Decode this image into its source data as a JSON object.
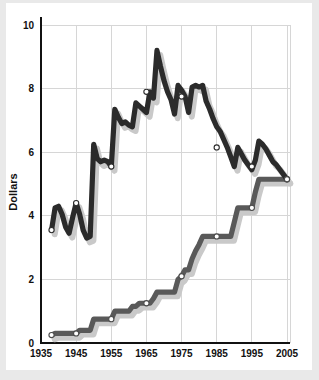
{
  "chart_data": {
    "type": "line",
    "title": "",
    "xlabel": "",
    "ylabel": "Dollars",
    "xlim": [
      1935,
      2005
    ],
    "ylim": [
      0,
      10
    ],
    "grid": true,
    "legend": "none",
    "x_ticks": [
      "1935",
      "1945",
      "1955",
      "1965",
      "1975",
      "1985",
      "1995",
      "2005"
    ],
    "y_ticks": [
      "0",
      "2",
      "4",
      "6",
      "8",
      "10"
    ],
    "x_tick_values": [
      1935,
      1945,
      1955,
      1965,
      1975,
      1985,
      1995,
      2005
    ],
    "y_tick_values": [
      0,
      2,
      4,
      6,
      8,
      10
    ],
    "marker_years": [
      1935,
      1945,
      1955,
      1965,
      1975,
      1985,
      1995,
      2005
    ],
    "series": [
      {
        "name": "Real (inflation-adjusted) minimum wage",
        "color": "#2b2b2b",
        "x": [
          1938,
          1939,
          1940,
          1941,
          1942,
          1943,
          1944,
          1945,
          1946,
          1947,
          1948,
          1949,
          1950,
          1951,
          1952,
          1953,
          1954,
          1955,
          1956,
          1957,
          1958,
          1959,
          1960,
          1961,
          1962,
          1963,
          1964,
          1965,
          1966,
          1967,
          1968,
          1969,
          1970,
          1971,
          1972,
          1973,
          1974,
          1975,
          1976,
          1977,
          1978,
          1979,
          1980,
          1981,
          1982,
          1983,
          1984,
          1985,
          1986,
          1987,
          1988,
          1989,
          1990,
          1991,
          1992,
          1993,
          1994,
          1995,
          1996,
          1997,
          1998,
          1999,
          2000,
          2001,
          2002,
          2003,
          2004,
          2005
        ],
        "y": [
          3.55,
          4.25,
          4.3,
          4.05,
          3.65,
          3.45,
          3.95,
          4.4,
          4.05,
          3.55,
          3.3,
          3.35,
          6.25,
          5.8,
          5.7,
          5.75,
          5.7,
          5.55,
          7.35,
          7.1,
          6.9,
          6.95,
          6.85,
          6.8,
          7.55,
          7.45,
          7.35,
          7.25,
          7.9,
          7.7,
          9.2,
          8.7,
          8.25,
          7.9,
          7.65,
          7.2,
          8.1,
          7.95,
          7.75,
          7.25,
          8.05,
          8.1,
          8.05,
          8.1,
          7.6,
          7.35,
          7.05,
          6.8,
          6.65,
          6.4,
          6.15,
          5.85,
          5.55,
          6.15,
          5.95,
          5.75,
          5.6,
          5.45,
          5.75,
          6.35,
          6.25,
          6.1,
          5.9,
          5.7,
          5.6,
          5.45,
          5.3,
          5.15
        ]
      },
      {
        "name": "Nominal minimum wage",
        "color": "#595959",
        "x": [
          1938,
          1939,
          1940,
          1941,
          1942,
          1943,
          1944,
          1945,
          1946,
          1947,
          1948,
          1949,
          1950,
          1951,
          1952,
          1953,
          1954,
          1955,
          1956,
          1957,
          1958,
          1959,
          1960,
          1961,
          1962,
          1963,
          1964,
          1965,
          1966,
          1967,
          1968,
          1969,
          1970,
          1971,
          1972,
          1973,
          1974,
          1975,
          1976,
          1977,
          1978,
          1979,
          1980,
          1981,
          1982,
          1983,
          1984,
          1985,
          1986,
          1987,
          1988,
          1989,
          1990,
          1991,
          1992,
          1993,
          1994,
          1995,
          1996,
          1997,
          1998,
          1999,
          2000,
          2001,
          2002,
          2003,
          2004,
          2005
        ],
        "y": [
          0.25,
          0.3,
          0.3,
          0.3,
          0.3,
          0.3,
          0.3,
          0.3,
          0.4,
          0.4,
          0.4,
          0.4,
          0.75,
          0.75,
          0.75,
          0.75,
          0.75,
          0.75,
          1.0,
          1.0,
          1.0,
          1.0,
          1.0,
          1.15,
          1.15,
          1.25,
          1.25,
          1.25,
          1.25,
          1.4,
          1.6,
          1.6,
          1.6,
          1.6,
          1.6,
          1.6,
          2.0,
          2.1,
          2.3,
          2.3,
          2.65,
          2.9,
          3.1,
          3.35,
          3.35,
          3.35,
          3.35,
          3.35,
          3.35,
          3.35,
          3.35,
          3.35,
          3.8,
          4.25,
          4.25,
          4.25,
          4.25,
          4.25,
          4.75,
          5.15,
          5.15,
          5.15,
          5.15,
          5.15,
          5.15,
          5.15,
          5.15,
          5.15
        ]
      }
    ],
    "marker_points": [
      {
        "series": "real",
        "x": 1938,
        "y": 3.55
      },
      {
        "series": "real",
        "x": 1945,
        "y": 4.4
      },
      {
        "series": "real",
        "x": 1955,
        "y": 5.55
      },
      {
        "series": "real",
        "x": 1965,
        "y": 7.9
      },
      {
        "series": "real",
        "x": 1975,
        "y": 7.75
      },
      {
        "series": "real",
        "x": 1985,
        "y": 6.15
      },
      {
        "series": "real",
        "x": 1995,
        "y": 5.55
      },
      {
        "series": "real",
        "x": 2005,
        "y": 5.15
      },
      {
        "series": "nominal",
        "x": 1938,
        "y": 0.25
      },
      {
        "series": "nominal",
        "x": 1945,
        "y": 0.3
      },
      {
        "series": "nominal",
        "x": 1955,
        "y": 0.75
      },
      {
        "series": "nominal",
        "x": 1965,
        "y": 1.25
      },
      {
        "series": "nominal",
        "x": 1975,
        "y": 2.1
      },
      {
        "series": "nominal",
        "x": 1985,
        "y": 3.35
      },
      {
        "series": "nominal",
        "x": 1995,
        "y": 4.25
      },
      {
        "series": "nominal",
        "x": 2005,
        "y": 5.15
      }
    ]
  },
  "axis": {
    "ylabel": "Dollars"
  },
  "colors": {
    "real_line": "#2b2b2b",
    "nominal_line": "#595959",
    "shadow": "#c9c9c9",
    "gridline": "#d6d6d6",
    "axis": "#111111",
    "background": "#ffffff",
    "frame": "#e9e9e9"
  }
}
